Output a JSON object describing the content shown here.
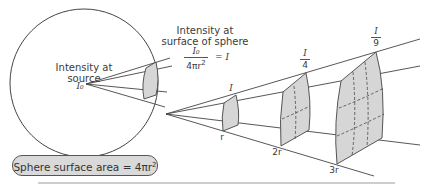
{
  "sphere": {
    "source_label_line1": "Intensity at",
    "source_label_line2": "source",
    "source_symbol": "I₀",
    "surface_area_label": "Sphere surface area = 4πr",
    "surface_area_exponent": "2"
  },
  "surface_intensity": {
    "label_line1": "Intensity at",
    "label_line2": "surface of sphere",
    "fraction_numerator": "I₀",
    "fraction_denominator": "4πr",
    "fraction_denominator_exponent": "2",
    "equals": "= I"
  },
  "patches": [
    {
      "distance": "r",
      "intensity": "I"
    },
    {
      "distance": "2r",
      "intensity_numerator": "I",
      "intensity_denominator": "4"
    },
    {
      "distance": "3r",
      "intensity_numerator": "I",
      "intensity_denominator": "9"
    }
  ],
  "colors": {
    "line": "#3a3a3a",
    "patch_fill": "#d6d6d6",
    "pill_fill": "#d9d9d9",
    "divider": "#bdbdbd"
  }
}
